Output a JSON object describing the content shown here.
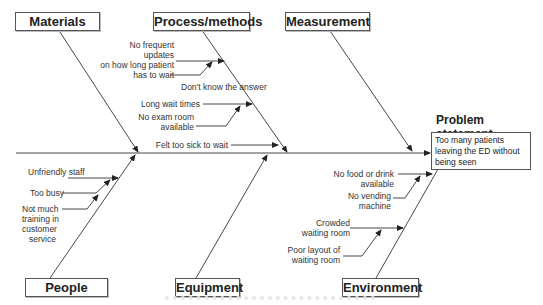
{
  "diagram": {
    "type": "fishbone",
    "problem": {
      "title": "Problem statement",
      "text": "Too many patients leaving the ED without being seen"
    },
    "categories": [
      {
        "id": "materials",
        "label": "Materials",
        "causes": []
      },
      {
        "id": "process",
        "label": "Process/methods",
        "causes": [
          {
            "text": "No frequent updates on how long patient has to wait",
            "sub": [
              "Don't know the answer"
            ]
          },
          {
            "text": "Long wait times",
            "sub": [
              "No exam room available"
            ]
          },
          {
            "text": "Felt too sick to wait",
            "sub": []
          }
        ]
      },
      {
        "id": "measurement",
        "label": "Measurement",
        "causes": []
      },
      {
        "id": "people",
        "label": "People",
        "causes": [
          {
            "text": "Unfriendly staff",
            "sub": [
              "Too busy",
              "Not much training in customer service"
            ]
          }
        ]
      },
      {
        "id": "equipment",
        "label": "Equipment",
        "causes": []
      },
      {
        "id": "environment",
        "label": "Environment",
        "causes": [
          {
            "text": "No food or drink available",
            "sub": [
              "No vending machine"
            ]
          },
          {
            "text": "Crowded waiting room",
            "sub": [
              "Poor layout of waiting room"
            ]
          }
        ]
      }
    ],
    "labels": {
      "materials": "Materials",
      "process": "Process/methods",
      "measurement": "Measurement",
      "people": "People",
      "equipment": "Equipment",
      "environment": "Environment"
    },
    "cause_text": {
      "no_updates_1": "No frequent updates",
      "no_updates_2": "on how long patient",
      "no_updates_3": "has to wait",
      "dont_know": "Don't know the answer",
      "long_wait": "Long wait times",
      "no_exam_1": "No exam room",
      "no_exam_2": "available",
      "felt_sick": "Felt too sick to wait",
      "unfriendly": "Unfriendly staff",
      "too_busy": "Too busy",
      "training_1": "Not much",
      "training_2": "training in",
      "training_3": "customer",
      "training_4": "service",
      "no_food_1": "No food or drink",
      "no_food_2": "available",
      "no_vending_1": "No vending",
      "no_vending_2": "machine",
      "crowded_1": "Crowded",
      "crowded_2": "waiting room",
      "poor_layout_1": "Poor layout of",
      "poor_layout_2": "waiting room"
    },
    "colors": {
      "line": "#333333",
      "box_border": "#555555",
      "background": "#ffffff"
    }
  }
}
